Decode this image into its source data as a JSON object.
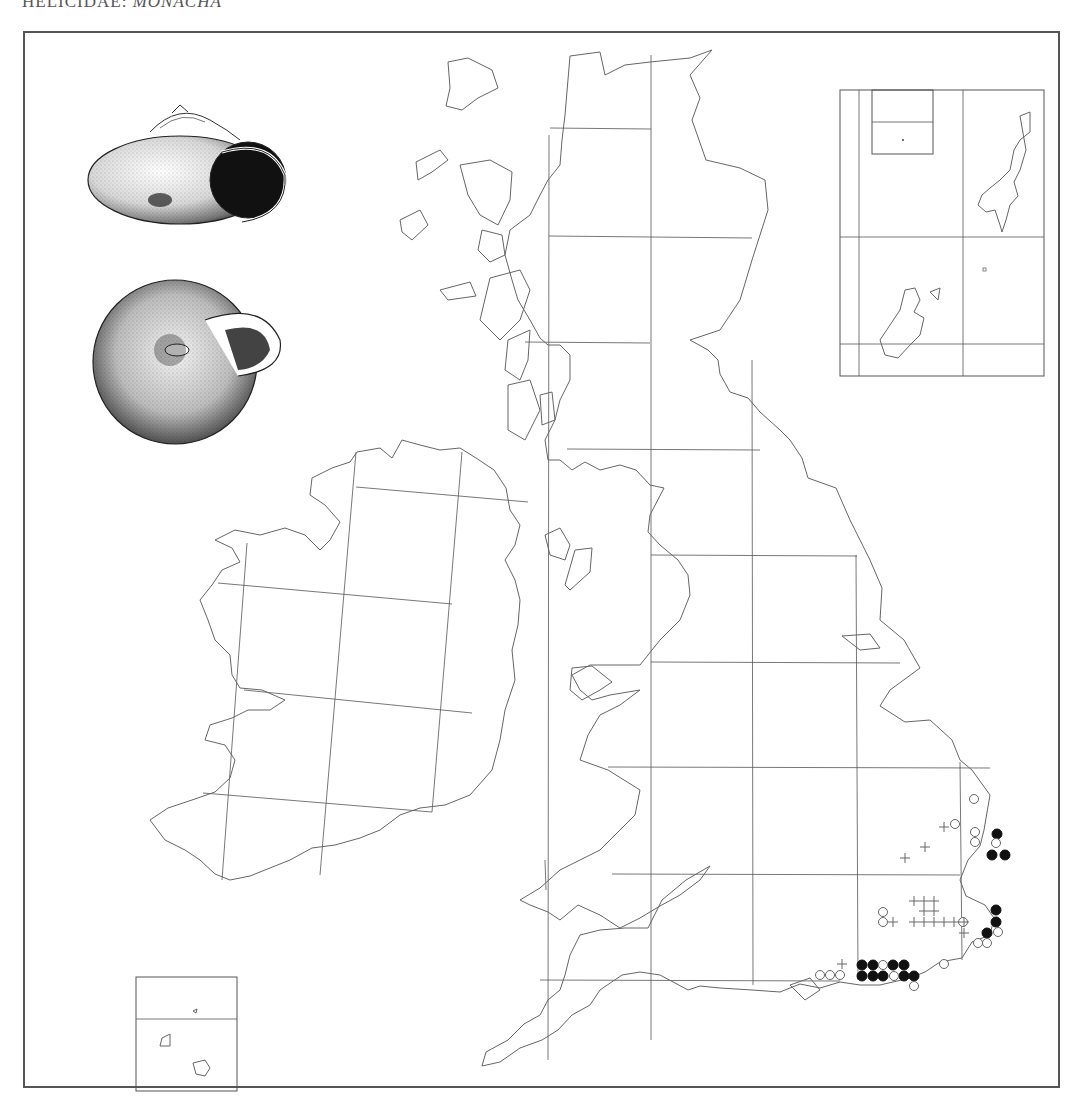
{
  "header": {
    "family": "HELICIDAE:",
    "genus": "MONACHA"
  },
  "illustrations": [
    {
      "name": "shell-side-view",
      "description": "Shell, apertural/side view"
    },
    {
      "name": "shell-umbilical-view",
      "description": "Shell, umbilical view"
    }
  ],
  "map": {
    "regions": [
      "Great Britain",
      "Ireland",
      "Orkney (inset)",
      "Shetland (inset)",
      "Channel Islands (inset)"
    ],
    "grid": "100 km squares",
    "legend_symbols": {
      "filled_circle": "recent record",
      "open_circle": "older record",
      "cross": "introduced / casual record"
    },
    "colors": {
      "ink": "#111111",
      "outline": "#666666",
      "frame": "#555555"
    }
  },
  "records": {
    "filled": [
      [
        997,
        834
      ],
      [
        992,
        855
      ],
      [
        1005,
        855
      ],
      [
        996,
        910
      ],
      [
        996,
        922
      ],
      [
        987,
        933
      ],
      [
        862,
        965
      ],
      [
        873,
        965
      ],
      [
        893,
        965
      ],
      [
        904,
        965
      ],
      [
        862,
        976
      ],
      [
        873,
        976
      ],
      [
        883,
        976
      ],
      [
        904,
        976
      ],
      [
        914,
        976
      ]
    ],
    "open": [
      [
        974,
        799
      ],
      [
        955,
        824
      ],
      [
        975,
        832
      ],
      [
        975,
        842
      ],
      [
        996,
        843
      ],
      [
        883,
        912
      ],
      [
        883,
        922
      ],
      [
        963,
        922
      ],
      [
        998,
        932
      ],
      [
        978,
        943
      ],
      [
        987,
        943
      ],
      [
        944,
        964
      ],
      [
        883,
        965
      ],
      [
        820,
        975
      ],
      [
        830,
        975
      ],
      [
        840,
        975
      ],
      [
        894,
        976
      ],
      [
        914,
        986
      ]
    ],
    "cross": [
      [
        944,
        827
      ],
      [
        925,
        847
      ],
      [
        905,
        858
      ],
      [
        914,
        901
      ],
      [
        924,
        901
      ],
      [
        934,
        901
      ],
      [
        924,
        911
      ],
      [
        934,
        911
      ],
      [
        893,
        922
      ],
      [
        914,
        922
      ],
      [
        924,
        922
      ],
      [
        934,
        922
      ],
      [
        944,
        922
      ],
      [
        954,
        922
      ],
      [
        964,
        922
      ],
      [
        964,
        933
      ],
      [
        842,
        964
      ]
    ]
  }
}
